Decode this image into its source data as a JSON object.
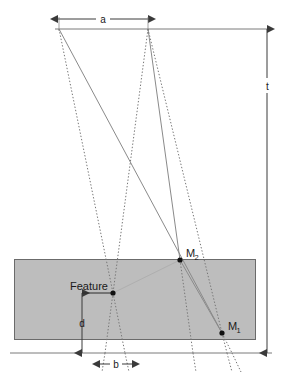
{
  "figure": {
    "type": "technical-line-diagram"
  },
  "labels": {
    "dim_a": "a",
    "dim_b": "b",
    "dim_d": "d",
    "dim_t": "t",
    "feature": "Feature",
    "m1_base": "M",
    "m1_sub": "1",
    "m2_base": "M",
    "m2_sub": "2"
  },
  "colors": {
    "slab_fill": "#bdbdbd",
    "slab_stroke": "#6b6b6b",
    "line": "#555555",
    "dotted": "#777777",
    "dimension": "#3a3a3a",
    "text": "#1a1a1a",
    "background": "#ffffff"
  },
  "geometry": {
    "slab": {
      "x": 14,
      "y": 259,
      "width": 242,
      "height": 81
    },
    "baseline_y": 353,
    "top_reference_y": 29,
    "source_left": {
      "x": 59,
      "y": 29
    },
    "source_right": {
      "x": 148,
      "y": 29
    },
    "feature_point": {
      "x": 113,
      "y": 293
    },
    "m1_point": {
      "x": 222,
      "y": 333
    },
    "m2_point": {
      "x": 180,
      "y": 260
    },
    "dim_a_span": {
      "x1": 58,
      "x2": 148,
      "y": 19
    },
    "dim_b_span": {
      "x1": 100,
      "x2": 132,
      "y": 364
    },
    "dim_d_span": {
      "x": 82,
      "y1": 293,
      "y2": 353
    },
    "dim_t_span": {
      "x": 267,
      "y1": 29,
      "y2": 353
    }
  },
  "ray_paths": {
    "from_left_source": [
      "to feature point then continuing to baseline",
      "to M1 marker then continuing below baseline"
    ],
    "from_right_source": [
      "to feature point then continuing to baseline",
      "to M2 marker then continuing to baseline",
      "to M1 marker then continuing below baseline"
    ]
  }
}
